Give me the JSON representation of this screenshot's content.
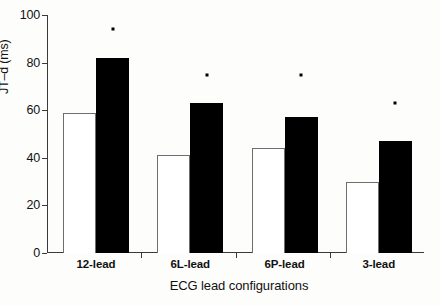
{
  "chart_data": {
    "type": "bar",
    "title": "",
    "subtitle": "",
    "xlabel": "ECG lead configurations",
    "ylabel": "JT–d (ms)",
    "categories": [
      "12-lead",
      "6L-lead",
      "6P-lead",
      "3-lead"
    ],
    "ylim": [
      0,
      100
    ],
    "yticks": [
      0,
      20,
      40,
      60,
      80,
      100
    ],
    "ytick_labels": [
      "0",
      "20",
      "40",
      "60",
      "80",
      "100"
    ],
    "grid": false,
    "legend": null,
    "series": [
      {
        "name": "open",
        "fill": "#ffffff",
        "edge": "#6e6e6e",
        "values": [
          59,
          41,
          44,
          30
        ]
      },
      {
        "name": "filled",
        "fill": "#000000",
        "edge": "#000000",
        "values": [
          82,
          63,
          57,
          47
        ]
      }
    ],
    "annotations": [
      {
        "text": "*",
        "category": "12-lead",
        "y": 94
      },
      {
        "text": "*",
        "category": "6L-lead",
        "y": 75
      },
      {
        "text": "*",
        "category": "6P-lead",
        "y": 75
      },
      {
        "text": "*",
        "category": "3-lead",
        "y": 63
      }
    ],
    "axis_color": "#3a3a3a"
  }
}
